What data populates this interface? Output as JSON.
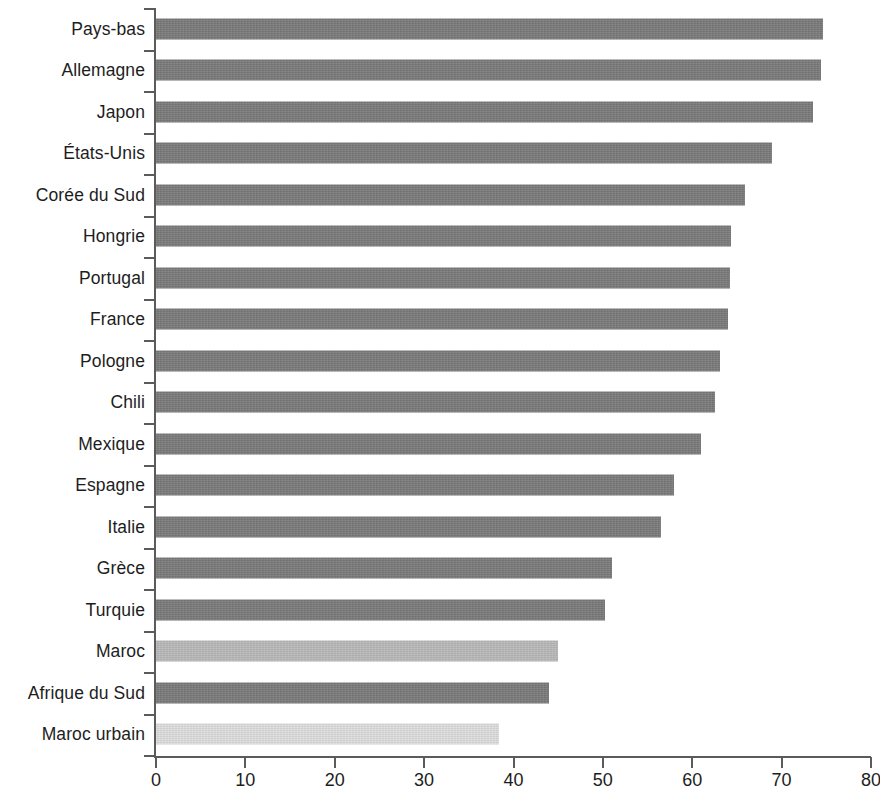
{
  "chart_data": {
    "type": "bar",
    "orientation": "horizontal",
    "title": "",
    "subtitle": "",
    "xlabel": "",
    "ylabel": "",
    "xlim": [
      0,
      80
    ],
    "xticks": [
      0,
      10,
      20,
      30,
      40,
      50,
      60,
      70,
      80
    ],
    "grid": false,
    "legend": null,
    "categories": [
      "Pays-bas",
      "Allemagne",
      "Japon",
      "États-Unis",
      "Corée du Sud",
      "Hongrie",
      "Portugal",
      "France",
      "Pologne",
      "Chili",
      "Mexique",
      "Espagne",
      "Italie",
      "Grèce",
      "Turquie",
      "Maroc",
      "Afrique du Sud",
      "Maroc urbain"
    ],
    "values": [
      74.6,
      74.4,
      73.5,
      68.9,
      65.9,
      64.3,
      64.2,
      64.0,
      63.1,
      62.6,
      61.0,
      58.0,
      56.5,
      51.0,
      50.2,
      45.0,
      44.0,
      38.4
    ],
    "bar_colors": [
      "#7a7a7a",
      "#7a7a7a",
      "#7a7a7a",
      "#7a7a7a",
      "#7a7a7a",
      "#7a7a7a",
      "#7a7a7a",
      "#7a7a7a",
      "#7a7a7a",
      "#7a7a7a",
      "#7a7a7a",
      "#7a7a7a",
      "#7a7a7a",
      "#7a7a7a",
      "#7a7a7a",
      "#b9b9b9",
      "#7a7a7a",
      "#dedede"
    ],
    "axis_color": "#5b5b5b",
    "text_color": "#1d1d1d",
    "background": "#ffffff"
  }
}
